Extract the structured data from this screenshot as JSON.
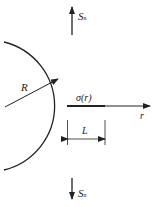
{
  "figure": {
    "type": "crack-at-circular-hole",
    "labels": {
      "stress_top": "S",
      "stress_top_sub": "n",
      "stress_bottom": "S",
      "stress_bottom_sub": "n",
      "radius": "R",
      "stress_field": "σ(r)",
      "axis": "r",
      "crack_length": "L"
    },
    "colors": {
      "stroke": "#222222",
      "background": "#ffffff"
    }
  }
}
